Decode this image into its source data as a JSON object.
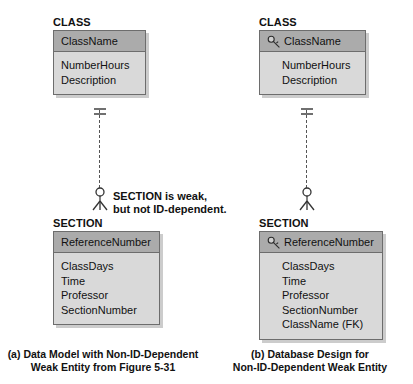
{
  "figure": {
    "panels": [
      {
        "id": "a",
        "caption_line1": "(a) Data Model with Non-ID-Dependent",
        "caption_line2": "Weak Entity from Figure 5-31",
        "parent": {
          "title": "CLASS",
          "key_attribute": "ClassName",
          "has_key_icon": false,
          "attributes": [
            "NumberHours",
            "Description"
          ]
        },
        "child": {
          "title": "SECTION",
          "key_attribute": "ReferenceNumber",
          "has_key_icon": false,
          "attributes": [
            "ClassDays",
            "Time",
            "Professor",
            "SectionNumber"
          ]
        },
        "relationship": {
          "line_style": "dashed",
          "parent_end": "one-mandatory",
          "child_end": "optional-many"
        },
        "annotation_line1": "SECTION is weak,",
        "annotation_line2": "but not ID-dependent."
      },
      {
        "id": "b",
        "caption_line1": "(b) Database Design for",
        "caption_line2": "Non-ID-Dependent Weak Entity",
        "parent": {
          "title": "CLASS",
          "key_attribute": "ClassName",
          "has_key_icon": true,
          "attributes": [
            "NumberHours",
            "Description"
          ]
        },
        "child": {
          "title": "SECTION",
          "key_attribute": "ReferenceNumber",
          "has_key_icon": true,
          "attributes": [
            "ClassDays",
            "Time",
            "Professor",
            "SectionNumber",
            "ClassName (FK)"
          ]
        },
        "relationship": {
          "line_style": "dashed",
          "parent_end": "one-mandatory",
          "child_end": "optional-many"
        },
        "annotation_line1": "",
        "annotation_line2": ""
      }
    ],
    "colors": {
      "header_fill": "#ababab",
      "body_fill": "#d9d9d9",
      "border": "#6d6d6d",
      "line": "#555555",
      "text": "#111111"
    }
  }
}
